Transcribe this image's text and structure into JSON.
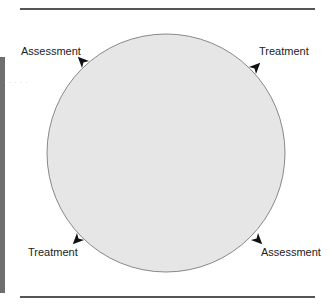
{
  "diagram": {
    "type": "cycle",
    "shape": "circle",
    "fill_color": "#e6e6e6",
    "stroke_color": "#888888",
    "arrow_color": "#111111",
    "direction": "clockwise",
    "labels": [
      {
        "position": "top-left",
        "text": "Assessment"
      },
      {
        "position": "top-right",
        "text": "Treatment"
      },
      {
        "position": "bottom-right",
        "text": "Assessment"
      },
      {
        "position": "bottom-left",
        "text": "Treatment"
      }
    ]
  }
}
